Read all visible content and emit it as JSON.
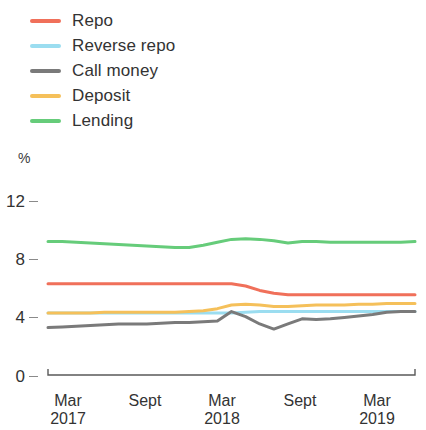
{
  "legend": {
    "position": "top-left",
    "items": [
      {
        "label": "Repo",
        "color": "#f0705a",
        "key": "repo"
      },
      {
        "label": "Reverse repo",
        "color": "#9bddf0",
        "key": "reverse_repo"
      },
      {
        "label": "Call money",
        "color": "#7a7a7a",
        "key": "call_money"
      },
      {
        "label": "Deposit",
        "color": "#f5c05a",
        "key": "deposit"
      },
      {
        "label": "Lending",
        "color": "#66cc7a",
        "key": "lending"
      }
    ]
  },
  "axes": {
    "y_unit": "%",
    "y_ticks": [
      "12",
      "8",
      "4",
      "0"
    ],
    "x_ticks": [
      {
        "month": "Mar",
        "year": "2017"
      },
      {
        "month": "Sept",
        "year": ""
      },
      {
        "month": "Mar",
        "year": "2018"
      },
      {
        "month": "Sept",
        "year": ""
      },
      {
        "month": "Mar",
        "year": "2019"
      }
    ]
  },
  "chart_data": {
    "type": "line",
    "title": "",
    "xlabel": "",
    "ylabel": "%",
    "ylim": [
      0,
      12
    ],
    "yticks": [
      0,
      4,
      8,
      12
    ],
    "grid": false,
    "legend_position": "top-left",
    "x": [
      "Mar 2017",
      "Apr 2017",
      "May 2017",
      "Jun 2017",
      "Jul 2017",
      "Aug 2017",
      "Sept 2017",
      "Oct 2017",
      "Nov 2017",
      "Dec 2017",
      "Jan 2018",
      "Feb 2018",
      "Mar 2018",
      "Apr 2018",
      "May 2018",
      "Jun 2018",
      "Jul 2018",
      "Aug 2018",
      "Sept 2018",
      "Oct 2018",
      "Nov 2018",
      "Dec 2018",
      "Jan 2019",
      "Feb 2019",
      "Mar 2019",
      "Apr 2019",
      "May 2019"
    ],
    "x_tick_labels": [
      "Mar 2017",
      "Sept",
      "Mar 2018",
      "Sept",
      "Mar 2019"
    ],
    "series": [
      {
        "name": "Repo",
        "color": "#f0705a",
        "values": [
          6.25,
          6.25,
          6.25,
          6.25,
          6.25,
          6.25,
          6.25,
          6.25,
          6.25,
          6.25,
          6.25,
          6.25,
          6.25,
          6.25,
          6.1,
          5.8,
          5.6,
          5.5,
          5.5,
          5.5,
          5.5,
          5.5,
          5.5,
          5.5,
          5.5,
          5.5,
          5.5
        ]
      },
      {
        "name": "Reverse repo",
        "color": "#9bddf0",
        "values": [
          4.25,
          4.25,
          4.25,
          4.25,
          4.25,
          4.25,
          4.25,
          4.25,
          4.25,
          4.25,
          4.25,
          4.25,
          4.25,
          4.25,
          4.3,
          4.35,
          4.35,
          4.35,
          4.35,
          4.35,
          4.35,
          4.35,
          4.35,
          4.35,
          4.35,
          4.35,
          4.35
        ]
      },
      {
        "name": "Call money",
        "color": "#7a7a7a",
        "values": [
          3.25,
          3.3,
          3.35,
          3.4,
          3.45,
          3.5,
          3.5,
          3.5,
          3.55,
          3.6,
          3.6,
          3.65,
          3.7,
          4.35,
          4.0,
          3.5,
          3.15,
          3.5,
          3.85,
          3.8,
          3.85,
          3.95,
          4.05,
          4.15,
          4.3,
          4.35,
          4.35
        ]
      },
      {
        "name": "Deposit",
        "color": "#f5c05a",
        "values": [
          4.25,
          4.25,
          4.25,
          4.25,
          4.3,
          4.3,
          4.3,
          4.3,
          4.3,
          4.3,
          4.35,
          4.4,
          4.55,
          4.8,
          4.85,
          4.8,
          4.7,
          4.7,
          4.75,
          4.8,
          4.8,
          4.8,
          4.85,
          4.85,
          4.9,
          4.9,
          4.9
        ]
      },
      {
        "name": "Lending",
        "color": "#66cc7a",
        "values": [
          9.15,
          9.15,
          9.1,
          9.05,
          9.0,
          8.95,
          8.9,
          8.85,
          8.8,
          8.75,
          8.75,
          8.9,
          9.1,
          9.3,
          9.35,
          9.3,
          9.2,
          9.05,
          9.15,
          9.15,
          9.1,
          9.1,
          9.1,
          9.1,
          9.1,
          9.1,
          9.15
        ]
      }
    ]
  },
  "geometry": {
    "plot_left": 48,
    "plot_right": 415,
    "y_zero_px": 375,
    "y_twelve_px": 200,
    "x_tick_px": [
      68,
      145,
      222,
      300,
      377
    ]
  }
}
